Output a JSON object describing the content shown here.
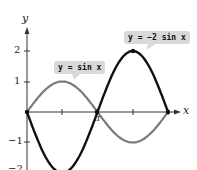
{
  "chart_data": {
    "type": "line",
    "title": "",
    "xlabel": "x",
    "ylabel": "y",
    "x_ticks": [
      "π/2",
      "π",
      "3π/2",
      "2π"
    ],
    "x_tick_labels_shown": [
      "π"
    ],
    "y_ticks": [
      2,
      1,
      -1,
      -2
    ],
    "y_tick_labels": [
      "2",
      "1",
      "−1",
      "−2"
    ],
    "xlim": [
      0,
      6.2832
    ],
    "ylim": [
      -2.2,
      2.5
    ],
    "grid": false,
    "series": [
      {
        "name": "y = sin x",
        "color": "#7a7a7a",
        "x": [
          0,
          1.5708,
          3.1416,
          4.7124,
          6.2832
        ],
        "values": [
          0,
          1,
          0,
          -1,
          0
        ]
      },
      {
        "name": "y = −2 sin x",
        "color": "#111111",
        "x": [
          0,
          1.5708,
          3.1416,
          4.7124,
          6.2832
        ],
        "values": [
          0,
          -2,
          0,
          2,
          0
        ]
      }
    ],
    "annotations": [
      "y = sin x",
      "y = −2 sin x"
    ]
  },
  "labels": {
    "sin": "y = sin x",
    "neg2sin": "y = −2 sin x",
    "x_axis": "x",
    "y_axis": "y",
    "pi": "π",
    "y2": "2",
    "y1": "1",
    "yn1": "−1",
    "yn2": "−2"
  }
}
